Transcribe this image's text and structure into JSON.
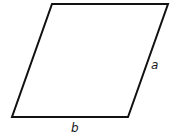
{
  "diagram": {
    "type": "parallelogram",
    "stroke_color": "#111111",
    "stroke_width": 2,
    "fill_color": "#ffffff",
    "vertices": {
      "top_left": [
        52,
        4
      ],
      "top_right": [
        168,
        4
      ],
      "bottom_right": [
        128,
        117
      ],
      "bottom_left": [
        12,
        117
      ]
    },
    "labels": {
      "side_a": {
        "text": "a",
        "x": 151,
        "y": 69
      },
      "side_b": {
        "text": "b",
        "x": 71,
        "y": 132
      }
    }
  }
}
